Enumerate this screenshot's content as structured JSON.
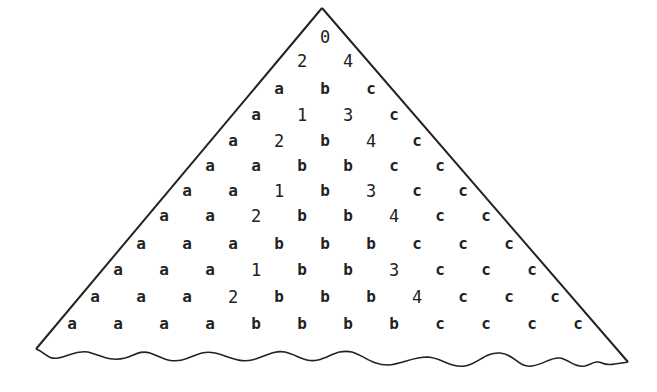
{
  "diagram": {
    "type": "triangular-array",
    "colors": {
      "ink": "#222222",
      "background": "#ffffff"
    },
    "apex": [
      322,
      8
    ],
    "bottom_left": [
      36,
      349
    ],
    "bottom_right": [
      628,
      362
    ],
    "origin_x": 325,
    "row_y": [
      37,
      61,
      89,
      115,
      141,
      166,
      191,
      216,
      244,
      270,
      297,
      324
    ],
    "col_step": 46,
    "rows": [
      [
        "0"
      ],
      [
        "2",
        "4"
      ],
      [
        "a",
        "b",
        "c"
      ],
      [
        "a",
        "1",
        "3",
        "c"
      ],
      [
        "a",
        "2",
        "b",
        "4",
        "c"
      ],
      [
        "a",
        "a",
        "b",
        "b",
        "c",
        "c"
      ],
      [
        "a",
        "a",
        "1",
        "b",
        "3",
        "c",
        "c"
      ],
      [
        "a",
        "a",
        "2",
        "b",
        "b",
        "4",
        "c",
        "c"
      ],
      [
        "a",
        "a",
        "a",
        "b",
        "b",
        "b",
        "c",
        "c",
        "c"
      ],
      [
        "a",
        "a",
        "a",
        "1",
        "b",
        "b",
        "3",
        "c",
        "c",
        "c"
      ],
      [
        "a",
        "a",
        "a",
        "2",
        "b",
        "b",
        "b",
        "4",
        "c",
        "c",
        "c"
      ],
      [
        "a",
        "a",
        "a",
        "a",
        "b",
        "b",
        "b",
        "b",
        "c",
        "c",
        "c",
        "c"
      ]
    ]
  }
}
